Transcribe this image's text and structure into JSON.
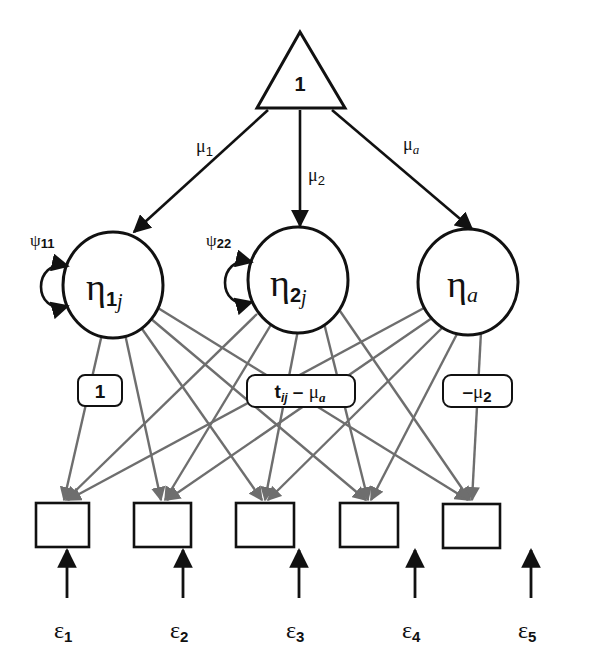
{
  "diagram": {
    "type": "structural-equation-path-diagram",
    "colors": {
      "background": "#ffffff",
      "stroke_black": "#111111",
      "loading_gray": "#6e6e6e"
    },
    "constant": {
      "label": "1",
      "shape": "triangle"
    },
    "mean_paths": [
      {
        "from": "constant",
        "to": "eta1",
        "symbol": "μ",
        "sub": "1",
        "sub_italic": false
      },
      {
        "from": "constant",
        "to": "eta2",
        "symbol": "μ",
        "sub": "2",
        "sub_italic": false
      },
      {
        "from": "constant",
        "to": "etaa",
        "symbol": "μ",
        "sub": "a",
        "sub_italic": true
      }
    ],
    "latent_factors": [
      {
        "id": "eta1",
        "symbol": "η",
        "sub": "1",
        "sub2": "j",
        "variance": {
          "symbol": "ψ",
          "sub": "11"
        }
      },
      {
        "id": "eta2",
        "symbol": "η",
        "sub": "2",
        "sub2": "j",
        "variance": {
          "symbol": "ψ",
          "sub": "22"
        }
      },
      {
        "id": "etaa",
        "symbol": "η",
        "sub": "",
        "sub2": "a",
        "variance": null
      }
    ],
    "loading_labels": [
      {
        "factor": "eta1",
        "text": "1"
      },
      {
        "factor": "eta2",
        "main": "t",
        "sub": "ij",
        "op": " – ",
        "symbol": "μ",
        "sub2": "a"
      },
      {
        "factor": "etaa",
        "prefix": "–",
        "symbol": "μ",
        "sub": "2"
      }
    ],
    "indicators": [
      {
        "id": "y1",
        "error": {
          "symbol": "ε",
          "sub": "1"
        }
      },
      {
        "id": "y2",
        "error": {
          "symbol": "ε",
          "sub": "2"
        }
      },
      {
        "id": "y3",
        "error": {
          "symbol": "ε",
          "sub": "3"
        }
      },
      {
        "id": "y4",
        "error": {
          "symbol": "ε",
          "sub": "4"
        }
      },
      {
        "id": "y5",
        "error": {
          "symbol": "ε",
          "sub": "5"
        }
      }
    ]
  }
}
